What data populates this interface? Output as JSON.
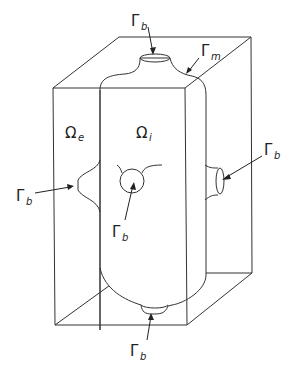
{
  "diagram": {
    "type": "3D schematic",
    "colors": {
      "stroke": "#333333",
      "background": "#ffffff",
      "text": "#222222"
    },
    "labels": {
      "omega_e": {
        "symbol": "Ω",
        "sub": "e"
      },
      "omega_i": {
        "symbol": "Ω",
        "sub": "i"
      },
      "gamma_m": {
        "symbol": "Γ",
        "sub": "m"
      },
      "gamma_b_top": {
        "symbol": "Γ",
        "sub": "b"
      },
      "gamma_b_left": {
        "symbol": "Γ",
        "sub": "b"
      },
      "gamma_b_center": {
        "symbol": "Γ",
        "sub": "b"
      },
      "gamma_b_right": {
        "symbol": "Γ",
        "sub": "b"
      },
      "gamma_b_bottom": {
        "symbol": "Γ",
        "sub": "b"
      }
    }
  }
}
